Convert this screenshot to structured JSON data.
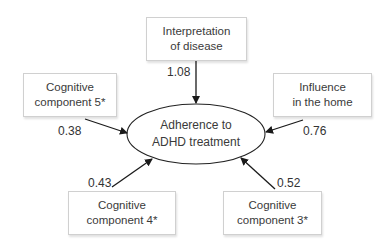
{
  "diagram": {
    "type": "path-diagram",
    "outcome": {
      "line1": "Adherence to",
      "line2": "ADHD treatment"
    },
    "predictors": [
      {
        "id": "interpretation",
        "line1": "Interpretation",
        "line2": "of disease",
        "weight": "1.08"
      },
      {
        "id": "cog5",
        "line1": "Cognitive",
        "line2": "component 5*",
        "weight": "0.38"
      },
      {
        "id": "influence",
        "line1": "Influence",
        "line2": "in the home",
        "weight": "0.76"
      },
      {
        "id": "cog4",
        "line1": "Cognitive",
        "line2": "component 4*",
        "weight": "0.43"
      },
      {
        "id": "cog3",
        "line1": "Cognitive",
        "line2": "component 3*",
        "weight": "0.52"
      }
    ]
  }
}
